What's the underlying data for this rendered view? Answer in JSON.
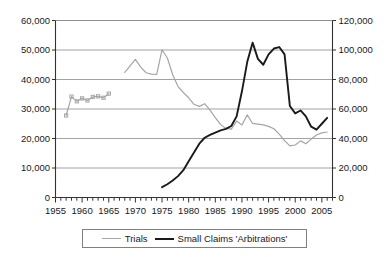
{
  "chart_data": {
    "type": "line",
    "title": "",
    "subtitle": "",
    "xlabel": "",
    "ylabel": "",
    "y2label": "",
    "xlim": [
      1955,
      2007
    ],
    "ylim": [
      0,
      60000
    ],
    "y2lim": [
      0,
      120000
    ],
    "grid": true,
    "grid_axis": "y",
    "legend_position": "bottom-center",
    "x_tick_labels": [
      "1955",
      "1960",
      "1965",
      "1970",
      "1975",
      "1980",
      "1985",
      "1990",
      "1995",
      "2000",
      "2005"
    ],
    "x_tick_values": [
      1955,
      1960,
      1965,
      1970,
      1975,
      1980,
      1985,
      1990,
      1995,
      2000,
      2005
    ],
    "x_minor_tick_interval": 1,
    "y_left_tick_labels": [
      "0",
      "10,000",
      "20,000",
      "30,000",
      "40,000",
      "50,000",
      "60,000"
    ],
    "y_left_tick_values": [
      0,
      10000,
      20000,
      30000,
      40000,
      50000,
      60000
    ],
    "y_right_tick_labels": [
      "0",
      "20,000",
      "40,000",
      "60,000",
      "80,000",
      "100,000",
      "120,000"
    ],
    "y_right_tick_values": [
      0,
      20000,
      40000,
      60000,
      80000,
      100000,
      120000
    ],
    "series": [
      {
        "name": "Trials",
        "color": "#a6a6a6",
        "axis": "left",
        "marker": "square",
        "segments": [
          {
            "note": "early markered segment 1957-1965",
            "markers": true,
            "x": [
              1957,
              1958,
              1959,
              1960,
              1961,
              1962,
              1963,
              1964,
              1965
            ],
            "y": [
              27800,
              34200,
              32600,
              33600,
              32900,
              34100,
              34300,
              33800,
              35200
            ]
          },
          {
            "note": "main continuous segment 1968-2006",
            "markers": false,
            "x": [
              1968,
              1969,
              1970,
              1971,
              1972,
              1973,
              1974,
              1975,
              1976,
              1977,
              1978,
              1979,
              1980,
              1981,
              1982,
              1983,
              1984,
              1985,
              1986,
              1987,
              1988,
              1989,
              1990,
              1991,
              1992,
              1993,
              1994,
              1995,
              1996,
              1997,
              1998,
              1999,
              2000,
              2001,
              2002,
              2003,
              2004,
              2005,
              2006
            ],
            "y": [
              42400,
              44600,
              46800,
              44200,
              42300,
              41800,
              41700,
              50100,
              47300,
              41600,
              37600,
              35600,
              33800,
              31600,
              30900,
              31800,
              29600,
              27100,
              24700,
              23400,
              23200,
              25900,
              24600,
              28000,
              25100,
              24900,
              24600,
              24100,
              23300,
              21500,
              19300,
              17500,
              17800,
              19200,
              18200,
              19800,
              21200,
              21900,
              22200
            ]
          }
        ]
      },
      {
        "name": "Small Claims 'Arbitrations'",
        "color": "#1a1a1a",
        "axis": "right",
        "marker": "none",
        "segments": [
          {
            "note": "continuous 1975-2006 on right axis",
            "markers": false,
            "x": [
              1975,
              1976,
              1977,
              1978,
              1979,
              1980,
              1981,
              1982,
              1983,
              1984,
              1985,
              1986,
              1987,
              1988,
              1989,
              1990,
              1991,
              1992,
              1993,
              1994,
              1995,
              1996,
              1997,
              1998,
              1999,
              2000,
              2001,
              2002,
              2003,
              2004,
              2005,
              2006
            ],
            "y": [
              7000,
              9000,
              11500,
              14500,
              18500,
              24500,
              30500,
              36500,
              40500,
              42500,
              44000,
              45500,
              46500,
              48500,
              55000,
              72000,
              92000,
              105000,
              94000,
              90000,
              97000,
              101000,
              102000,
              97000,
              62000,
              57000,
              59000,
              55000,
              48000,
              46000,
              50000,
              54000
            ]
          }
        ]
      }
    ]
  },
  "legend": {
    "items": [
      {
        "label": "Trials",
        "color": "#a6a6a6"
      },
      {
        "label": "Small Claims 'Arbitrations'",
        "color": "#1a1a1a"
      }
    ]
  }
}
